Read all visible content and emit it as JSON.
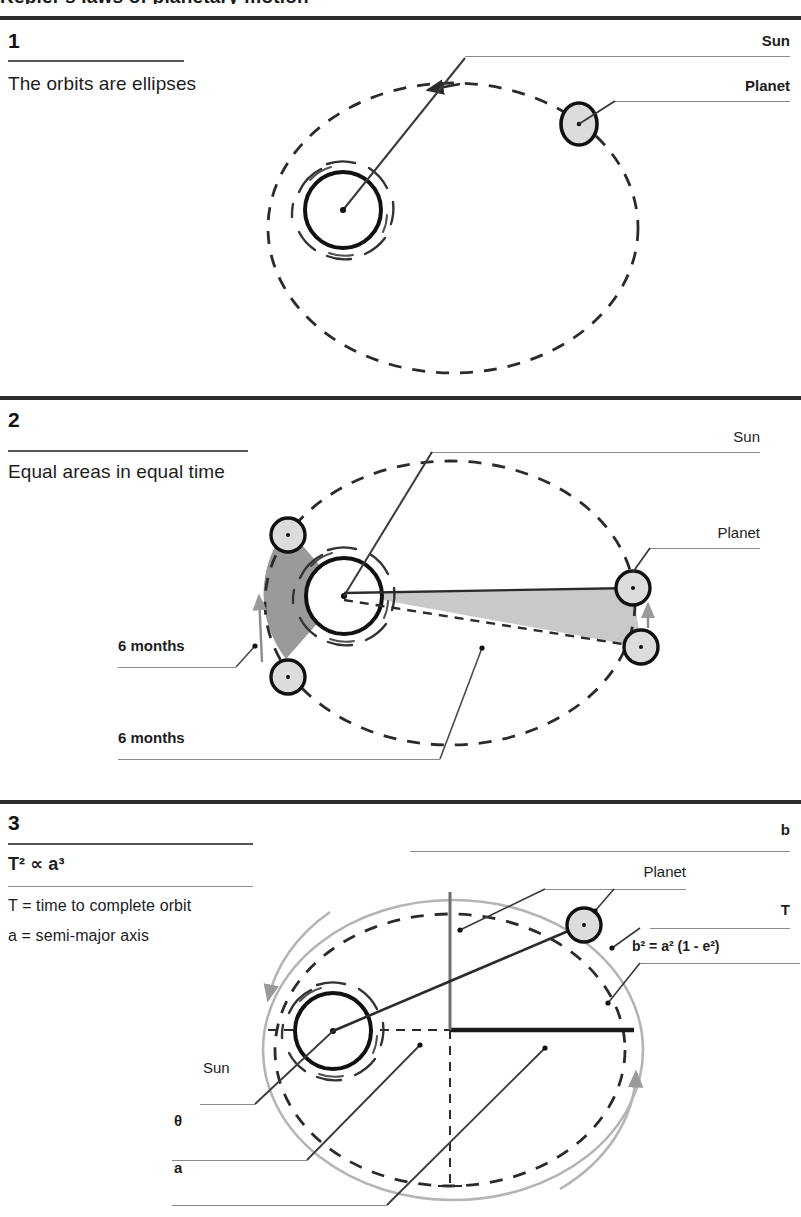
{
  "document": {
    "title": "Kepler's laws of planetary motion",
    "title_visible_fragment": "Kepler's laws of planetary motion"
  },
  "colors": {
    "ink": "#1a1a1a",
    "rule_heavy": "#2b2b2b",
    "rule_light": "#8a8a8a",
    "leader": "#6e6e6e",
    "sun_stroke": "#111111",
    "planet_fill": "#dcdcdc",
    "area_dark": "#9a9a9a",
    "area_light": "#c9c9c9",
    "orbit_outer": "#b5b5b5"
  },
  "sections": [
    {
      "number": "1",
      "description": "The orbits are ellipses",
      "labels": [
        {
          "id": "sun",
          "text": "Sun",
          "bold": true
        },
        {
          "id": "planet",
          "text": "Planet",
          "bold": true
        }
      ]
    },
    {
      "number": "2",
      "description": "Equal areas in equal time",
      "labels": [
        {
          "id": "sun",
          "text": "Sun",
          "bold": false
        },
        {
          "id": "planet",
          "text": "Planet",
          "bold": false
        },
        {
          "id": "months-1",
          "text": "6 months",
          "bold": true
        },
        {
          "id": "months-2",
          "text": "6 months",
          "bold": true
        }
      ]
    },
    {
      "number": "3",
      "description": "T² ∝ a³",
      "formula": "T² ∝ a³",
      "legend": [
        {
          "id": "T",
          "text": "T = time to complete orbit"
        },
        {
          "id": "a",
          "text": "a = semi-major axis"
        }
      ],
      "labels": [
        {
          "id": "b",
          "text": "b",
          "bold": true
        },
        {
          "id": "planet",
          "text": "Planet",
          "bold": false
        },
        {
          "id": "T",
          "text": "T",
          "bold": true
        },
        {
          "id": "formula",
          "text": "b² = a² (1 - e²)",
          "bold": true
        },
        {
          "id": "sun",
          "text": "Sun",
          "bold": false
        },
        {
          "id": "theta",
          "text": "θ",
          "bold": true
        },
        {
          "id": "a",
          "text": "a",
          "bold": true
        }
      ]
    }
  ],
  "icons": {
    "sun": "sun-icon",
    "planet": "planet-icon",
    "arrow": "direction-arrow-icon"
  }
}
